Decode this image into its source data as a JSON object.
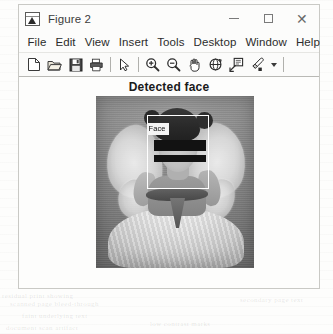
{
  "window": {
    "title": "Figure 2",
    "app_icon": "matlab-figure-icon",
    "controls": {
      "minimize": "minimize-icon",
      "maximize": "maximize-icon",
      "close": "close-icon"
    }
  },
  "menubar": {
    "items": [
      {
        "label": "File"
      },
      {
        "label": "Edit"
      },
      {
        "label": "View"
      },
      {
        "label": "Insert"
      },
      {
        "label": "Tools"
      },
      {
        "label": "Desktop"
      },
      {
        "label": "Window"
      },
      {
        "label": "Help"
      }
    ]
  },
  "toolbar": {
    "buttons": [
      {
        "name": "new-figure-icon"
      },
      {
        "name": "open-file-icon"
      },
      {
        "name": "save-figure-icon"
      },
      {
        "name": "print-figure-icon"
      },
      {
        "name": "pointer-arrow-icon"
      },
      {
        "name": "zoom-in-icon"
      },
      {
        "name": "zoom-out-icon"
      },
      {
        "name": "pan-hand-icon"
      },
      {
        "name": "rotate-3d-icon"
      },
      {
        "name": "data-cursor-icon"
      },
      {
        "name": "brush-icon"
      },
      {
        "name": "chevron-down-icon"
      }
    ]
  },
  "figure": {
    "title": "Detected face",
    "image": {
      "description": "grayscale photo of a child wearing a fairy costume with wings",
      "detections": [
        {
          "label": "Face"
        }
      ]
    }
  },
  "background": {
    "ghost_lines": [
      "scanned page bleed-through",
      "faint underlying text",
      "document scan artifact",
      "secondary page text",
      "residual print showing",
      "low contrast marks"
    ]
  },
  "colors": {
    "window_bg": "#fbfbfa",
    "border": "#c9c9c5",
    "text": "#2c2c2c",
    "bbox": "#ffffff",
    "page_bg": "#fdfdfc"
  }
}
